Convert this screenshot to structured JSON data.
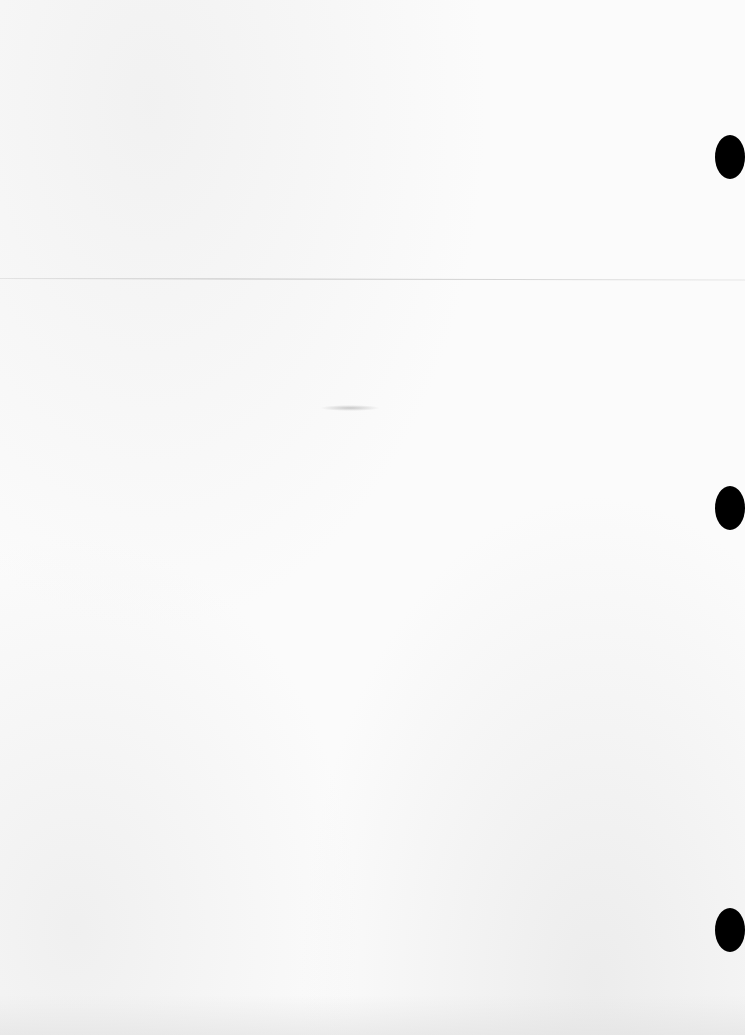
{
  "document": {
    "type": "blank scanned page",
    "text_content": "",
    "punch_holes": [
      {
        "x": 715,
        "y": 135
      },
      {
        "x": 715,
        "y": 486
      },
      {
        "x": 715,
        "y": 908
      }
    ],
    "fold_line_y": 278,
    "colors": {
      "paper": "#fbfbfb",
      "punch_hole": "#000000"
    }
  }
}
